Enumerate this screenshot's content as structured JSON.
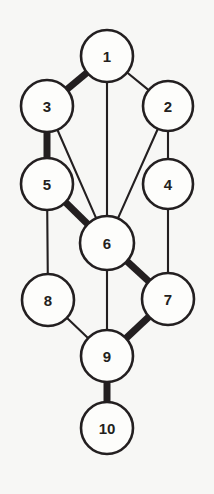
{
  "diagram": {
    "kind": "node-link-diagram",
    "canvas": {
      "width": 214,
      "height": 494
    },
    "colors": {
      "background": "#f7f7f5",
      "node_fill": "#fdfdfb",
      "stroke": "#231f20",
      "label": "#231f20"
    },
    "nodes": [
      {
        "id": "1",
        "label": "1",
        "cx": 107,
        "cy": 56,
        "r": 26
      },
      {
        "id": "2",
        "label": "2",
        "cx": 168,
        "cy": 106,
        "r": 25
      },
      {
        "id": "3",
        "label": "3",
        "cx": 47,
        "cy": 106,
        "r": 26
      },
      {
        "id": "4",
        "label": "4",
        "cx": 168,
        "cy": 184,
        "r": 25
      },
      {
        "id": "5",
        "label": "5",
        "cx": 47,
        "cy": 184,
        "r": 26
      },
      {
        "id": "6",
        "label": "6",
        "cx": 107,
        "cy": 243,
        "r": 27
      },
      {
        "id": "7",
        "label": "7",
        "cx": 168,
        "cy": 299,
        "r": 26
      },
      {
        "id": "8",
        "label": "8",
        "cx": 48,
        "cy": 300,
        "r": 26
      },
      {
        "id": "9",
        "label": "9",
        "cx": 107,
        "cy": 356,
        "r": 26
      },
      {
        "id": "10",
        "label": "10",
        "cx": 107,
        "cy": 428,
        "r": 26
      }
    ],
    "edges": [
      {
        "from": "1",
        "to": "3",
        "weight": "thick"
      },
      {
        "from": "1",
        "to": "2",
        "weight": "thin"
      },
      {
        "from": "1",
        "to": "6",
        "weight": "thin"
      },
      {
        "from": "3",
        "to": "5",
        "weight": "thick"
      },
      {
        "from": "3",
        "to": "6",
        "weight": "thin"
      },
      {
        "from": "2",
        "to": "4",
        "weight": "thin"
      },
      {
        "from": "2",
        "to": "6",
        "weight": "thin"
      },
      {
        "from": "5",
        "to": "6",
        "weight": "thick"
      },
      {
        "from": "5",
        "to": "8",
        "weight": "thin"
      },
      {
        "from": "4",
        "to": "7",
        "weight": "thin"
      },
      {
        "from": "6",
        "to": "7",
        "weight": "thick"
      },
      {
        "from": "6",
        "to": "9",
        "weight": "thin"
      },
      {
        "from": "8",
        "to": "9",
        "weight": "thin"
      },
      {
        "from": "7",
        "to": "9",
        "weight": "thick"
      },
      {
        "from": "9",
        "to": "10",
        "weight": "thick"
      }
    ]
  }
}
